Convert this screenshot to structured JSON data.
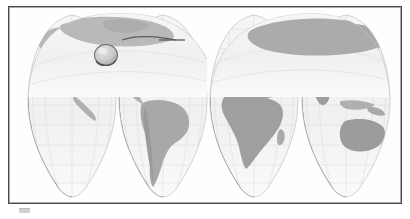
{
  "window": {
    "title": "World Map",
    "background_color": "#ffffff"
  },
  "frame": {
    "name": "map-frame",
    "border_color": "#4b4b4b",
    "inner_border_color": "#a9a9a9",
    "fill_color": "#fefefe"
  },
  "map": {
    "title": "World Map",
    "projection": "Goode homolosine (interrupted)",
    "style": "grayscale shaded relief",
    "ocean_color": "#f2f2f2",
    "land_color": "#b4b4b4",
    "land_color_dark": "#9a9a9a",
    "graticule_color": "#d9d9d9",
    "gore_edge_color": "#555555",
    "interruption_count": 4,
    "equator_y_ratio": 0.46,
    "gores": [
      {
        "name": "gore-north-america-pacific",
        "label": "North Pacific / North America",
        "center_x": 62
      },
      {
        "name": "gore-south-america",
        "label": "Americas / South America",
        "center_x": 140
      },
      {
        "name": "gore-africa-europe",
        "label": "Europe / Africa",
        "center_x": 228
      },
      {
        "name": "gore-asia-australia",
        "label": "Asia / Australia / Oceania",
        "center_x": 320
      }
    ],
    "continents": [
      {
        "name": "north-america",
        "gore": 1
      },
      {
        "name": "greenland",
        "gore": 1
      },
      {
        "name": "central-america",
        "gore": 2
      },
      {
        "name": "south-america",
        "gore": 2
      },
      {
        "name": "europe",
        "gore": 3
      },
      {
        "name": "africa",
        "gore": 3
      },
      {
        "name": "asia",
        "gore": 4
      },
      {
        "name": "australia",
        "gore": 4
      },
      {
        "name": "indonesia",
        "gore": 4
      }
    ]
  },
  "overlay": {
    "magnifier": {
      "name": "magnifier-lens",
      "label": "Lens over North America",
      "center_x": 106,
      "center_y": 54,
      "radius": 11,
      "fill_color": "#cfcfcf",
      "stroke_color": "#6a6a6a"
    },
    "pointer": {
      "name": "callout-pointer",
      "label": "Callout leader line",
      "from_x": 122,
      "from_y": 39,
      "to_x": 176,
      "to_y": 39,
      "color": "#555555"
    }
  },
  "footer": {
    "mark_label": "shadow artifact",
    "mark_color": "#c9c9c9"
  }
}
